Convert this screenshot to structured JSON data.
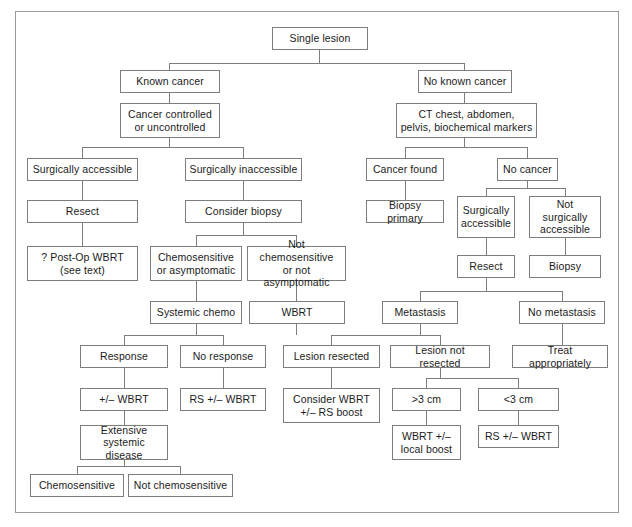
{
  "figure": {
    "type": "flowchart",
    "border_color": "#9b9b9b",
    "box_border_color": "#7d7d7d",
    "text_color": "#1b1b1b",
    "background": "#ffffff"
  },
  "nodes": {
    "root": "Single lesion",
    "known_cancer": "Known cancer",
    "no_known_cancer": "No known cancer",
    "cancer_controlled": "Cancer controlled\nor uncontrolled",
    "ct_workup": "CT chest, abdomen,\npelvis, biochemical markers",
    "surg_accessible_left": "Surgically accessible",
    "surg_inaccessible_left": "Surgically inaccessible",
    "resect_left": "Resect",
    "consider_biopsy": "Consider biopsy",
    "post_op_wbrt": "? Post-Op WBRT\n(see text)",
    "chemosensitive_or_asymptomatic": "Chemosensitive\nor asymptomatic",
    "not_chemosensitive_or_not_asymptomatic": "Not chemosensitive\nor not asymptomatic",
    "systemic_chemo": "Systemic chemo",
    "wbrt": "WBRT",
    "response": "Response",
    "no_response": "No response",
    "plus_minus_wbrt": "+/– WBRT",
    "rs_plus_minus_wbrt_left": "RS +/– WBRT",
    "extensive_systemic_disease": "Extensive\nsystemic disease",
    "chemosensitive": "Chemosensitive",
    "not_chemosensitive": "Not chemosensitive",
    "cancer_found": "Cancer found",
    "no_cancer": "No cancer",
    "biopsy_primary": "Biopsy primary",
    "surg_accessible_right": "Surgically\naccessible",
    "not_surg_accessible_right": "Not surgically\naccessible",
    "resect_right": "Resect",
    "biopsy_right": "Biopsy",
    "metastasis": "Metastasis",
    "no_metastasis": "No metastasis",
    "lesion_resected": "Lesion resected",
    "lesion_not_resected": "Lesion not resected",
    "treat_appropriately": "Treat appropriately",
    "consider_wbrt_rs_boost": "Consider WBRT\n+/– RS boost",
    "gt_3cm": ">3 cm",
    "lt_3cm": "<3 cm",
    "wbrt_local_boost": "WBRT +/–\nlocal boost",
    "rs_plus_minus_wbrt_right": "RS +/– WBRT"
  }
}
